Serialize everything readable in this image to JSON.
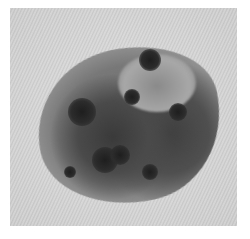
{
  "image": {
    "description": "Grayscale close-up photograph of an irregular pigmented skin lesion on textured skin, white border frame",
    "colors": {
      "frame": "#ffffff",
      "skin": "#d6d6d6",
      "lesion_body": "#707070",
      "dark_globules": "#222222"
    },
    "blobs": [
      {
        "x": 150,
        "y": 60,
        "r": 11
      },
      {
        "x": 132,
        "y": 97,
        "r": 8
      },
      {
        "x": 82,
        "y": 112,
        "r": 14
      },
      {
        "x": 105,
        "y": 160,
        "r": 13
      },
      {
        "x": 120,
        "y": 155,
        "r": 10
      },
      {
        "x": 178,
        "y": 112,
        "r": 9
      },
      {
        "x": 150,
        "y": 172,
        "r": 8
      },
      {
        "x": 70,
        "y": 172,
        "r": 6
      }
    ]
  }
}
